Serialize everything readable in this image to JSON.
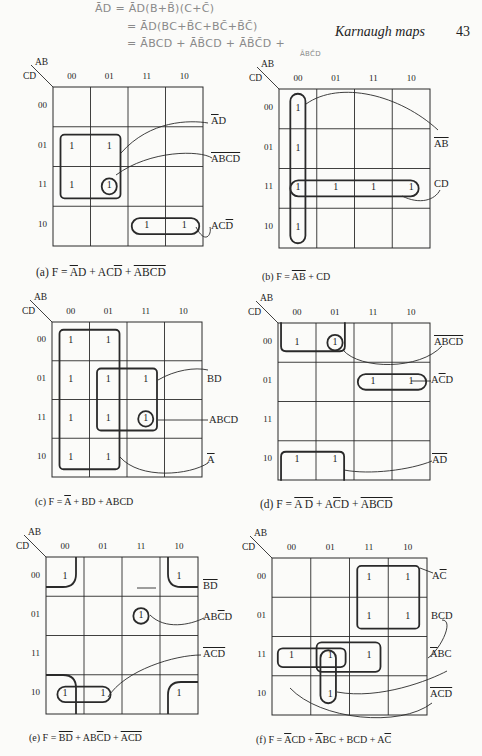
{
  "page": {
    "running_head": "Karnaugh maps",
    "page_number": "43",
    "handwritten_notes": [
      {
        "text": "ĀD = ĀD(B+B̄)(C+C̄)",
        "x": 95,
        "y": 2
      },
      {
        "text": "= ĀD(BC+B̄C+BC̄+B̄C̄)",
        "x": 127,
        "y": 20
      },
      {
        "text": "= ĀBCD + ĀB̄CD + ĀB̄C̄D +",
        "x": 127,
        "y": 37
      }
    ],
    "handwritten_small": {
      "text": "ĀBC̄D",
      "x": 300,
      "y": 50
    }
  },
  "maps": [
    {
      "id": "a",
      "x": 53,
      "y": 87,
      "w": 150,
      "h": 159,
      "col_header": "AB",
      "row_header": "CD",
      "cols": [
        "00",
        "01",
        "11",
        "10"
      ],
      "rows": [
        "00",
        "01",
        "11",
        "10"
      ],
      "ones": [
        [
          1,
          0
        ],
        [
          1,
          1
        ],
        [
          2,
          0
        ],
        [
          2,
          1
        ],
        [
          3,
          2
        ],
        [
          3,
          3
        ]
      ],
      "groups": [
        {
          "r0": 1.2,
          "c0": 0.2,
          "r1": 2.8,
          "c1": 1.8,
          "rad": 4
        },
        {
          "r0": 2.3,
          "c0": 1.3,
          "r1": 2.7,
          "c1": 1.7,
          "rad": 50
        },
        {
          "r0": 3.3,
          "c0": 2.1,
          "r1": 3.7,
          "c1": 3.9,
          "rad": 14
        }
      ],
      "leaders": [
        "M 121 153 C 150 120, 190 120, 208 123",
        "M 116 175 C 150 150, 200 150, 212 158",
        "M 196 227 C 205 245, 212 235, 210 227"
      ],
      "terms": [
        {
          "parts": [
            {
              "t": "A",
              "o": true
            },
            {
              "t": "D",
              "o": false
            }
          ],
          "x": 211,
          "y": 115
        },
        {
          "parts": [
            {
              "t": "ABCD",
              "o": true
            }
          ],
          "x": 211,
          "y": 153
        },
        {
          "parts": [
            {
              "t": "AC",
              "o": false
            },
            {
              "t": "D",
              "o": true
            }
          ],
          "x": 211,
          "y": 220
        }
      ],
      "caption": {
        "id": "a",
        "parts": [
          {
            "t": "(a) F = ",
            "o": false
          },
          {
            "t": "A",
            "o": true
          },
          {
            "t": "D + AC",
            "o": false
          },
          {
            "t": "D",
            "o": true
          },
          {
            "t": " + ",
            "o": false
          },
          {
            "t": "ABCD",
            "o": true
          }
        ],
        "x": 36,
        "y": 266
      }
    },
    {
      "id": "b",
      "x": 279,
      "y": 89,
      "w": 151,
      "h": 159,
      "col_header": "AB",
      "row_header": "CD",
      "cols": [
        "00",
        "01",
        "11",
        "10"
      ],
      "rows": [
        "00",
        "01",
        "11",
        "10"
      ],
      "ones": [
        [
          0,
          0
        ],
        [
          1,
          0
        ],
        [
          2,
          0
        ],
        [
          2,
          1
        ],
        [
          2,
          2
        ],
        [
          2,
          3
        ],
        [
          3,
          0
        ]
      ],
      "groups": [
        {
          "r0": 0.12,
          "c0": 0.3,
          "r1": 3.88,
          "c1": 0.7,
          "rad": 8
        },
        {
          "r0": 2.3,
          "c0": 0.3,
          "r1": 2.7,
          "c1": 3.7,
          "rad": 8
        }
      ],
      "leaders": [
        "M 306 104 C 340 80, 400 95, 438 130",
        "M 402 196 C 420 205, 435 200, 440 190"
      ],
      "terms": [
        {
          "parts": [
            {
              "t": "AB",
              "o": true
            }
          ],
          "x": 434,
          "y": 138
        },
        {
          "parts": [
            {
              "t": "CD",
              "o": false
            }
          ],
          "x": 434,
          "y": 178
        }
      ],
      "caption": {
        "id": "b",
        "parts": [
          {
            "t": "(b) F = ",
            "o": false
          },
          {
            "t": "AB",
            "o": true
          },
          {
            "t": " + CD",
            "o": false
          }
        ],
        "x": 262,
        "y": 271,
        "small": true
      }
    },
    {
      "id": "c",
      "x": 52,
      "y": 322,
      "w": 150,
      "h": 155,
      "col_header": "AB",
      "row_header": "CD",
      "cols": [
        "00",
        "01",
        "11",
        "10"
      ],
      "rows": [
        "00",
        "01",
        "11",
        "10"
      ],
      "ones": [
        [
          0,
          0
        ],
        [
          0,
          1
        ],
        [
          1,
          0
        ],
        [
          1,
          1
        ],
        [
          1,
          2
        ],
        [
          2,
          0
        ],
        [
          2,
          1
        ],
        [
          2,
          2
        ],
        [
          3,
          0
        ],
        [
          3,
          1
        ]
      ],
      "groups": [
        {
          "r0": 0.2,
          "c0": 0.2,
          "r1": 3.8,
          "c1": 1.8,
          "rad": 4
        },
        {
          "r0": 1.2,
          "c0": 1.2,
          "r1": 2.8,
          "c1": 2.8,
          "rad": 4
        },
        {
          "r0": 2.3,
          "c0": 2.3,
          "r1": 2.7,
          "c1": 2.7,
          "rad": 50
        }
      ],
      "leaders": [
        "M 158 380 C 175 370, 195 367, 208 370",
        "M 158 420 L 208 420",
        "M 120 457 C 140 480, 190 475, 208 463"
      ],
      "terms": [
        {
          "parts": [
            {
              "t": "BD",
              "o": false
            }
          ],
          "x": 207,
          "y": 373
        },
        {
          "parts": [
            {
              "t": "ABCD",
              "o": false
            }
          ],
          "x": 209,
          "y": 414
        },
        {
          "parts": [
            {
              "t": "A",
              "o": true
            }
          ],
          "x": 207,
          "y": 454
        }
      ],
      "caption": {
        "id": "c",
        "parts": [
          {
            "t": "(c) F = ",
            "o": false
          },
          {
            "t": "A",
            "o": true
          },
          {
            "t": " + BD + ABCD",
            "o": false
          }
        ],
        "x": 35,
        "y": 496,
        "small": true
      }
    },
    {
      "id": "d",
      "x": 278,
      "y": 323,
      "w": 152,
      "h": 157,
      "col_header": "AB",
      "row_header": "CD",
      "cols": [
        "00",
        "01",
        "11",
        "10"
      ],
      "rows": [
        "00",
        "01",
        "11",
        "10"
      ],
      "ones": [
        [
          0,
          0
        ],
        [
          0,
          1
        ],
        [
          1,
          2
        ],
        [
          1,
          3
        ],
        [
          3,
          0
        ],
        [
          3,
          1
        ]
      ],
      "groups": [
        {
          "r0": -0.02,
          "c0": 0.08,
          "r1": 0.72,
          "c1": 1.76,
          "rad": 5,
          "open": "top"
        },
        {
          "r0": 0.3,
          "c0": 1.3,
          "r1": 0.7,
          "c1": 1.7,
          "rad": 50
        },
        {
          "r0": 1.3,
          "c0": 2.1,
          "r1": 1.7,
          "c1": 3.9,
          "rad": 14
        },
        {
          "r0": 3.28,
          "c0": 0.08,
          "r1": 4.02,
          "c1": 1.74,
          "rad": 5,
          "open": "bottom"
        }
      ],
      "leaders": [
        "M 343 350 C 360 370, 420 370, 442 346",
        "M 411 381 L 431 381",
        "M 344 470 C 370 475, 410 470, 432 461"
      ],
      "terms": [
        {
          "parts": [
            {
              "t": "ABCD",
              "o": true
            }
          ],
          "x": 434,
          "y": 336
        },
        {
          "parts": [
            {
              "t": "A",
              "o": false
            },
            {
              "t": "C",
              "o": true
            },
            {
              "t": "D",
              "o": false
            }
          ],
          "x": 431,
          "y": 374
        },
        {
          "parts": [
            {
              "t": "AD",
              "o": true
            }
          ],
          "x": 432,
          "y": 454
        }
      ],
      "caption": {
        "id": "d",
        "parts": [
          {
            "t": "(d) F = ",
            "o": false
          },
          {
            "t": "A D",
            "o": true
          },
          {
            "t": " + A",
            "o": false
          },
          {
            "t": "C",
            "o": true
          },
          {
            "t": "D + ",
            "o": false
          },
          {
            "t": "ABCD",
            "o": true
          }
        ],
        "x": 260,
        "y": 498
      }
    },
    {
      "id": "e",
      "x": 46,
      "y": 557,
      "w": 152,
      "h": 157,
      "col_header": "AB",
      "row_header": "CD",
      "cols": [
        "00",
        "01",
        "11",
        "10"
      ],
      "rows": [
        "00",
        "01",
        "11",
        "10"
      ],
      "ones": [
        [
          0,
          0
        ],
        [
          0,
          3
        ],
        [
          1,
          2
        ],
        [
          3,
          0
        ],
        [
          3,
          1
        ],
        [
          3,
          3
        ]
      ],
      "groups": [
        {
          "path": "M 0 30 L 17 30 Q 30 30 30 17 L 30 0"
        },
        {
          "path": "M 152 30 L 135 30 Q 122 30 122 17 L 122 0"
        },
        {
          "path": "M 0 118 L 17 118 Q 30 118 30 131 L 30 157"
        },
        {
          "path": "M 152 125 L 135 125 Q 122 125 122 138 L 122 157"
        },
        {
          "r": "circle",
          "r0": 1.3,
          "c0": 2.3,
          "r1": 1.7,
          "c1": 2.7,
          "rad": 50
        },
        {
          "r0": 3.3,
          "c0": 0.3,
          "r1": 3.7,
          "c1": 1.7,
          "rad": 14
        }
      ],
      "leaders": [
        "M 137 588 L 156 588",
        "M 150 615 C 165 630, 190 625, 204 618",
        "M 108 697 C 125 670, 175 655, 201 655"
      ],
      "terms": [
        {
          "parts": [
            {
              "t": "BD",
              "o": true
            }
          ],
          "x": 203,
          "y": 580
        },
        {
          "parts": [
            {
              "t": "AB",
              "o": false
            },
            {
              "t": "C",
              "o": true
            },
            {
              "t": "D",
              "o": false
            }
          ],
          "x": 203,
          "y": 611
        },
        {
          "parts": [
            {
              "t": "ACD",
              "o": true
            }
          ],
          "x": 203,
          "y": 648
        }
      ],
      "caption": {
        "id": "e",
        "parts": [
          {
            "t": "(e) F = ",
            "o": false
          },
          {
            "t": "BD",
            "o": true
          },
          {
            "t": " + AB",
            "o": false
          },
          {
            "t": "C",
            "o": true
          },
          {
            "t": "D + ",
            "o": false
          },
          {
            "t": "ACD",
            "o": true
          }
        ],
        "x": 29,
        "y": 732,
        "small": true
      }
    },
    {
      "id": "f",
      "x": 272,
      "y": 558,
      "w": 155,
      "h": 157,
      "col_header": "AB",
      "row_header": "CD",
      "cols": [
        "00",
        "01",
        "11",
        "10"
      ],
      "rows": [
        "00",
        "01",
        "11",
        "10"
      ],
      "ones": [
        [
          0,
          2
        ],
        [
          0,
          3
        ],
        [
          1,
          2
        ],
        [
          1,
          3
        ],
        [
          2,
          0
        ],
        [
          2,
          1
        ],
        [
          2,
          2
        ],
        [
          3,
          1
        ]
      ],
      "groups": [
        {
          "r0": 0.2,
          "c0": 2.2,
          "r1": 1.8,
          "c1": 3.8,
          "rad": 4
        },
        {
          "r0": 2.3,
          "c0": 0.15,
          "r1": 2.78,
          "c1": 1.9,
          "rad": 5
        },
        {
          "r0": 2.15,
          "c0": 1.15,
          "r1": 2.9,
          "c1": 2.8,
          "rad": 5
        },
        {
          "r0": 2.35,
          "c0": 1.25,
          "r1": 3.7,
          "c1": 1.65,
          "rad": 10
        }
      ],
      "leaders": [
        "M 420 568 L 433 573",
        "M 428 658 C 440 650, 455 620, 442 620",
        "M 337 692 C 380 700, 430 680, 447 671",
        "M 290 688 C 320 720, 400 728, 432 703"
      ],
      "terms": [
        {
          "parts": [
            {
              "t": "A",
              "o": false
            },
            {
              "t": "C",
              "o": true
            }
          ],
          "x": 432,
          "y": 570
        },
        {
          "parts": [
            {
              "t": "BCD",
              "o": false
            }
          ],
          "x": 431,
          "y": 610
        },
        {
          "parts": [
            {
              "t": "A",
              "o": true
            },
            {
              "t": "BC",
              "o": false
            }
          ],
          "x": 430,
          "y": 648
        },
        {
          "parts": [
            {
              "t": "ACD",
              "o": true
            }
          ],
          "x": 430,
          "y": 688
        }
      ],
      "caption": {
        "id": "f",
        "parts": [
          {
            "t": "(f) F = ",
            "o": false
          },
          {
            "t": "A",
            "o": true
          },
          {
            "t": "CD + ",
            "o": false
          },
          {
            "t": "A",
            "o": true
          },
          {
            "t": "BC + BCD + A",
            "o": false
          },
          {
            "t": "C",
            "o": true
          }
        ],
        "x": 256,
        "y": 734,
        "small": true
      }
    }
  ]
}
